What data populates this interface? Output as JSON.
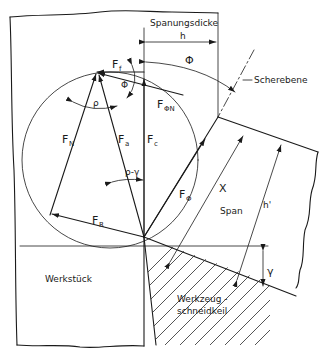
{
  "diagram": {
    "labels": {
      "chip_thickness": "Spanungsdicke",
      "h": "h",
      "phi_top": "Φ",
      "shear_plane": "Scherebene",
      "Ff_main": "F",
      "Ff_sub": "f",
      "phi_small": "Φ",
      "rho": "ρ",
      "FphiN_main": "F",
      "FphiN_sub": "ΦN",
      "FN_main": "F",
      "FN_sub": "N",
      "Fa_main": "F",
      "Fa_sub": "a",
      "Fc_main": "F",
      "Fc_sub": "c",
      "rho_minus_gamma": "ρ-γ",
      "Fphi_main": "F",
      "Fphi_sub": "Φ",
      "X": "X",
      "chip": "Span",
      "h_prime": "h'",
      "FR_main": "F",
      "FR_sub": "R",
      "gamma": "γ",
      "workpiece": "Werkstück",
      "tool_line1": "Werkzeug -",
      "tool_line2": "schneidkeil"
    }
  }
}
